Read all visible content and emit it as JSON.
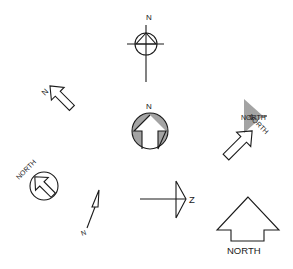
{
  "diagram": {
    "title": "",
    "symbols": [
      {
        "id": "circle-triangle-crosshair",
        "label": "N"
      },
      {
        "id": "hatched-arrowhead",
        "label": "NORTH"
      },
      {
        "id": "outline-arrow-diagonal-left",
        "label": "N"
      },
      {
        "id": "hatched-circle-arrow",
        "label": "N"
      },
      {
        "id": "outline-arrow-diagonal-right",
        "label": "NORTH"
      },
      {
        "id": "circle-arrow-diagonal",
        "label": "NORTH"
      },
      {
        "id": "thin-arrow",
        "label": "N"
      },
      {
        "id": "half-arrow-sideways",
        "label": "Z"
      },
      {
        "id": "large-block-arrow",
        "label": "NORTH"
      }
    ]
  },
  "colors": {
    "ink": "#1a1a1a",
    "background": "#ffffff"
  }
}
